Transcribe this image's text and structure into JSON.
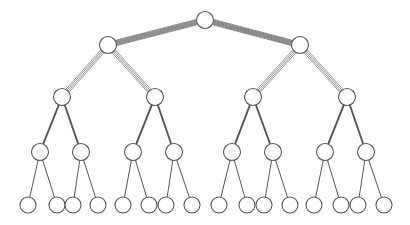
{
  "diagram": {
    "type": "tree",
    "depth": 5,
    "node_count": 31,
    "leaf_count": 16,
    "background_color": "#ffffff",
    "node_fill_color": "#ffffff",
    "node_stroke_color": "#565656",
    "edge_color": "#565656",
    "canvas": {
      "width": 410,
      "height": 225
    }
  },
  "levels": [
    {
      "index": 0,
      "name": "root-level",
      "y": 20,
      "radius": 8.5,
      "edge_style": "hatched-band",
      "edge_stroke_width": 0.6,
      "edge_strand_count": 7,
      "edge_strand_spacing": 0.9,
      "nodes": [
        {
          "id": "n0",
          "label": "",
          "x": 205
        }
      ]
    },
    {
      "index": 1,
      "name": "level-1",
      "y": 45,
      "radius": 8.5,
      "edge_style": "multi-strand",
      "edge_stroke_width": 0.6,
      "edge_strand_count": 4,
      "edge_strand_spacing": 1.4,
      "nodes": [
        {
          "id": "n1",
          "label": "",
          "x": 108,
          "parent": "n0"
        },
        {
          "id": "n2",
          "label": "",
          "x": 300,
          "parent": "n0"
        }
      ]
    },
    {
      "index": 2,
      "name": "level-2",
      "y": 97,
      "radius": 8.5,
      "edge_style": "thick-line",
      "edge_stroke_width": 1.9,
      "edge_strand_count": 1,
      "edge_strand_spacing": 0,
      "nodes": [
        {
          "id": "n3",
          "label": "",
          "x": 62,
          "parent": "n1"
        },
        {
          "id": "n4",
          "label": "",
          "x": 155,
          "parent": "n1"
        },
        {
          "id": "n5",
          "label": "",
          "x": 253,
          "parent": "n2"
        },
        {
          "id": "n6",
          "label": "",
          "x": 347,
          "parent": "n2"
        }
      ]
    },
    {
      "index": 3,
      "name": "level-3",
      "y": 152,
      "radius": 8.5,
      "edge_style": "thin-line",
      "edge_stroke_width": 1.0,
      "edge_strand_count": 1,
      "edge_strand_spacing": 0,
      "nodes": [
        {
          "id": "n7",
          "label": "",
          "x": 40,
          "parent": "n3"
        },
        {
          "id": "n8",
          "label": "",
          "x": 81,
          "parent": "n3"
        },
        {
          "id": "n9",
          "label": "",
          "x": 133,
          "parent": "n4"
        },
        {
          "id": "n10",
          "label": "",
          "x": 174,
          "parent": "n4"
        },
        {
          "id": "n11",
          "label": "",
          "x": 232,
          "parent": "n5"
        },
        {
          "id": "n12",
          "label": "",
          "x": 273,
          "parent": "n5"
        },
        {
          "id": "n13",
          "label": "",
          "x": 325,
          "parent": "n6"
        },
        {
          "id": "n14",
          "label": "",
          "x": 366,
          "parent": "n6"
        }
      ]
    },
    {
      "index": 4,
      "name": "leaf-level",
      "y": 205,
      "radius": 8.0,
      "edge_style": "none",
      "edge_stroke_width": 0,
      "edge_strand_count": 0,
      "edge_strand_spacing": 0,
      "nodes": [
        {
          "id": "n15",
          "label": "",
          "x": 28,
          "parent": "n7"
        },
        {
          "id": "n16",
          "label": "",
          "x": 57,
          "parent": "n7"
        },
        {
          "id": "n17",
          "label": "",
          "x": 73,
          "parent": "n8"
        },
        {
          "id": "n18",
          "label": "",
          "x": 98,
          "parent": "n8"
        },
        {
          "id": "n19",
          "label": "",
          "x": 123,
          "parent": "n9"
        },
        {
          "id": "n20",
          "label": "",
          "x": 149,
          "parent": "n9"
        },
        {
          "id": "n21",
          "label": "",
          "x": 166,
          "parent": "n10"
        },
        {
          "id": "n22",
          "label": "",
          "x": 192,
          "parent": "n10"
        },
        {
          "id": "n23",
          "label": "",
          "x": 219,
          "parent": "n11"
        },
        {
          "id": "n24",
          "label": "",
          "x": 247,
          "parent": "n11"
        },
        {
          "id": "n25",
          "label": "",
          "x": 264,
          "parent": "n12"
        },
        {
          "id": "n26",
          "label": "",
          "x": 290,
          "parent": "n12"
        },
        {
          "id": "n27",
          "label": "",
          "x": 314,
          "parent": "n13"
        },
        {
          "id": "n28",
          "label": "",
          "x": 341,
          "parent": "n13"
        },
        {
          "id": "n29",
          "label": "",
          "x": 358,
          "parent": "n14"
        },
        {
          "id": "n30",
          "label": "",
          "x": 384,
          "parent": "n14"
        }
      ]
    }
  ]
}
